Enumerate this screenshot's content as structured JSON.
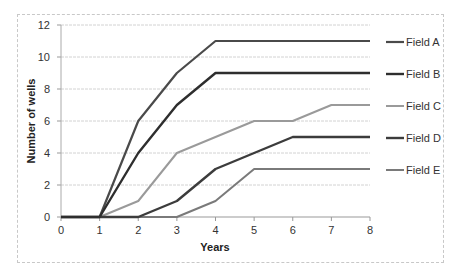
{
  "chart_data": {
    "type": "line",
    "title": "",
    "xlabel": "Years",
    "ylabel": "Number of wells",
    "x": [
      0,
      1,
      2,
      3,
      4,
      5,
      6,
      7,
      8
    ],
    "xlim": [
      0,
      8
    ],
    "ylim": [
      0,
      12
    ],
    "yticks": [
      0,
      2,
      4,
      6,
      8,
      10,
      12
    ],
    "xticks": [
      0,
      1,
      2,
      3,
      4,
      5,
      6,
      7,
      8
    ],
    "grid": "horizontal",
    "legend_position": "right",
    "series": [
      {
        "name": "Field A",
        "color": "#4a4a4a",
        "width": 2.2,
        "values": [
          0,
          0,
          6,
          9,
          11,
          11,
          11,
          11,
          11
        ]
      },
      {
        "name": "Field B",
        "color": "#2e2e2e",
        "width": 2.4,
        "values": [
          0,
          0,
          4,
          7,
          9,
          9,
          9,
          9,
          9
        ]
      },
      {
        "name": "Field C",
        "color": "#9a9a9a",
        "width": 2.0,
        "values": [
          0,
          0,
          1,
          4,
          5,
          6,
          6,
          7,
          7
        ]
      },
      {
        "name": "Field D",
        "color": "#3c3c3c",
        "width": 2.4,
        "values": [
          0,
          0,
          0,
          1,
          3,
          4,
          5,
          5,
          5
        ]
      },
      {
        "name": "Field E",
        "color": "#7a7a7a",
        "width": 2.0,
        "values": [
          0,
          0,
          0,
          0,
          1,
          3,
          3,
          3,
          3
        ]
      }
    ]
  }
}
